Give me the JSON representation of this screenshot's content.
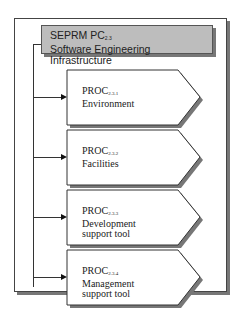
{
  "header": {
    "line1": "SEPRM PC",
    "line1_sub": "2.3",
    "line2": "Software Engineering Infrastructure"
  },
  "processes": [
    {
      "prefix": "PROC",
      "sub": "2.3.1",
      "lines": [
        "Environment"
      ]
    },
    {
      "prefix": "PROC",
      "sub": "2.3.2",
      "lines": [
        "Facilities"
      ]
    },
    {
      "prefix": "PROC",
      "sub": "2.3.3",
      "lines": [
        "Development",
        "support tool"
      ]
    },
    {
      "prefix": "PROC",
      "sub": "2.3.4",
      "lines": [
        "Management",
        "support tool"
      ]
    }
  ]
}
